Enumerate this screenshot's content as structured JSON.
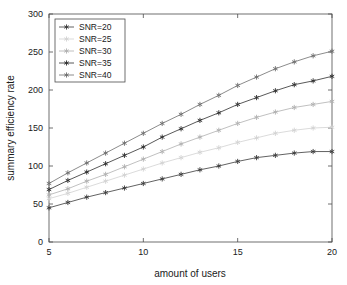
{
  "chart_data": {
    "type": "line",
    "title": "",
    "xlabel": "amount of users",
    "ylabel": "summary efficiency rate",
    "xlim": [
      5,
      20
    ],
    "ylim": [
      0,
      300
    ],
    "xticks": [
      5,
      10,
      15,
      20
    ],
    "yticks": [
      0,
      50,
      100,
      150,
      200,
      250,
      300
    ],
    "grid": false,
    "legend_position": "upper left",
    "marker": "asterisk",
    "x": [
      5,
      6,
      7,
      8,
      9,
      10,
      11,
      12,
      13,
      14,
      15,
      16,
      17,
      18,
      19,
      20
    ],
    "series": [
      {
        "name": "SNR=20",
        "color": "#3a3a3a",
        "values": [
          45,
          52,
          59,
          65,
          71,
          77,
          83,
          89,
          95,
          100,
          106,
          111,
          114,
          117,
          119,
          119
        ]
      },
      {
        "name": "SNR=25",
        "color": "#d2d2d2",
        "values": [
          57,
          64,
          72,
          80,
          88,
          96,
          104,
          111,
          118,
          124,
          131,
          137,
          143,
          147,
          150,
          151
        ]
      },
      {
        "name": "SNR=30",
        "color": "#b0b0b0",
        "values": [
          62,
          70,
          80,
          89,
          99,
          109,
          119,
          129,
          138,
          147,
          156,
          164,
          171,
          177,
          181,
          185
        ]
      },
      {
        "name": "SNR=35",
        "color": "#2e2e2e",
        "values": [
          69,
          81,
          92,
          103,
          114,
          125,
          138,
          149,
          160,
          170,
          181,
          190,
          199,
          207,
          212,
          218
        ]
      },
      {
        "name": "SNR=40",
        "color": "#6e6e6e",
        "values": [
          77,
          91,
          104,
          117,
          130,
          143,
          156,
          168,
          181,
          193,
          206,
          217,
          228,
          237,
          245,
          251
        ]
      }
    ]
  },
  "legend": {
    "entries": [
      {
        "label": "SNR=20"
      },
      {
        "label": "SNR=25"
      },
      {
        "label": "SNR=30"
      },
      {
        "label": "SNR=35"
      },
      {
        "label": "SNR=40"
      }
    ]
  },
  "axes": {
    "x_title": "amount of users",
    "y_title": "summary efficiency rate",
    "x_tick_labels": [
      "5",
      "10",
      "15",
      "20"
    ],
    "y_tick_labels": [
      "0",
      "50",
      "100",
      "150",
      "200",
      "250",
      "300"
    ]
  }
}
